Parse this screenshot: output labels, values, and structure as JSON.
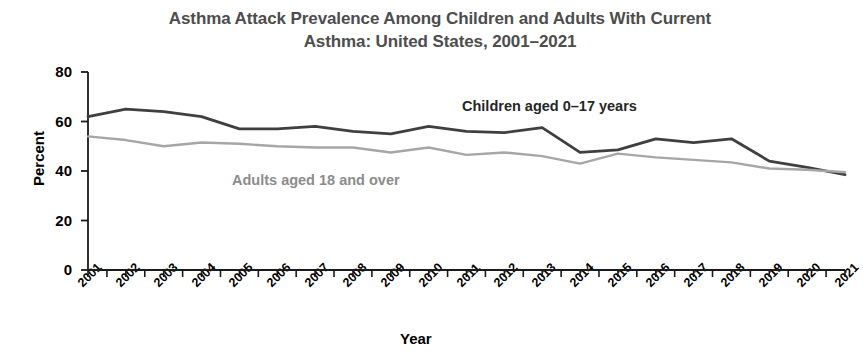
{
  "chart_data": {
    "type": "line",
    "title": "Asthma Attack Prevalence Among Children and Adults With Current Asthma: United States, 2001–2021",
    "title_line1": "Asthma Attack Prevalence Among Children and Adults With Current",
    "title_line2": "Asthma: United States, 2001–2021",
    "xlabel": "Year",
    "ylabel": "Percent",
    "ylim": [
      0,
      80
    ],
    "yticks": [
      0,
      20,
      40,
      60,
      80
    ],
    "grid": false,
    "legend_position": "inline-annotation",
    "categories": [
      "2001",
      "2002",
      "2003",
      "2004",
      "2005",
      "2006",
      "2007",
      "2008",
      "2009",
      "2010",
      "2011",
      "2012",
      "2013",
      "2014",
      "2015",
      "2016",
      "2017",
      "2018",
      "2019",
      "2020",
      "2021"
    ],
    "series": [
      {
        "name": "Children aged 0–17 years",
        "color": "#3f3f3f",
        "values": [
          62.0,
          65.0,
          64.0,
          62.0,
          57.0,
          57.0,
          58.0,
          56.0,
          55.0,
          58.0,
          56.0,
          55.5,
          57.5,
          47.5,
          48.5,
          53.0,
          51.5,
          53.0,
          44.0,
          41.5,
          38.5
        ]
      },
      {
        "name": "Adults aged 18 and over",
        "color": "#a6a6a6",
        "values": [
          54.0,
          52.5,
          50.0,
          51.5,
          51.0,
          50.0,
          49.5,
          49.5,
          47.5,
          49.5,
          46.5,
          47.5,
          46.0,
          43.0,
          47.0,
          45.5,
          44.5,
          43.5,
          41.0,
          40.5,
          39.5
        ]
      }
    ]
  },
  "axis": {
    "y_title": "Percent",
    "x_title": "Year"
  },
  "annotations": {
    "children_label": "Children aged 0–17 years",
    "adults_label": "Adults aged 18 and over"
  },
  "colors": {
    "children_line": "#3f3f3f",
    "adults_line": "#a6a6a6",
    "title_text": "#4d4d4d",
    "axis_text": "#000000",
    "background": "#ffffff"
  }
}
